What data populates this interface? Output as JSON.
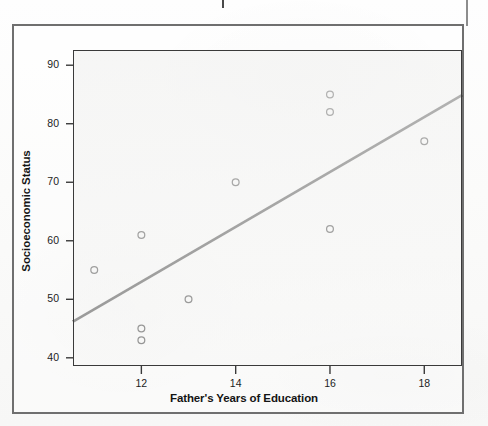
{
  "figure": {
    "kind": "scatterplot-with-regression-line",
    "background_style": "scanned-page"
  },
  "chart_data": {
    "type": "scatter",
    "title": "",
    "xlabel": "Father's Years of Education",
    "ylabel": "Socioeconomic Status",
    "xlim": [
      10.55,
      18.8
    ],
    "ylim": [
      38.6,
      92.6
    ],
    "xticks": [
      12,
      14,
      16,
      18
    ],
    "xtick_labels": [
      "12",
      "14",
      "16",
      "18"
    ],
    "yticks": [
      40,
      50,
      60,
      70,
      80,
      90
    ],
    "ytick_labels": [
      "40",
      "50",
      "60",
      "70",
      "80",
      "90"
    ],
    "grid": false,
    "legend": false,
    "marker": "open-circle",
    "marker_color": "#111111",
    "line_color": "#141414",
    "points": [
      {
        "x": 11,
        "y": 55
      },
      {
        "x": 12,
        "y": 61
      },
      {
        "x": 12,
        "y": 45
      },
      {
        "x": 12,
        "y": 43
      },
      {
        "x": 13,
        "y": 50
      },
      {
        "x": 14,
        "y": 70
      },
      {
        "x": 16,
        "y": 85
      },
      {
        "x": 16,
        "y": 82
      },
      {
        "x": 16,
        "y": 62
      },
      {
        "x": 18,
        "y": 77
      }
    ],
    "regression_line": {
      "x_start": 10.55,
      "y_start": 46.2,
      "x_end": 18.8,
      "y_end": 84.9
    }
  },
  "colors": {
    "outer_frame": "#6f6f6f",
    "plot_frame": "#3a3a3a",
    "text": "#141414",
    "plot_fill": "#f4f4f3"
  }
}
